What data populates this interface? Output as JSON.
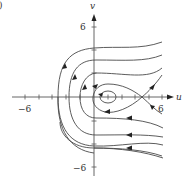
{
  "diagram": {
    "type": "phase-portrait",
    "corner_mark": ")",
    "axes": {
      "x_label": "u",
      "y_label": "v",
      "x_tick_labels": {
        "min": "−6",
        "max": "6"
      },
      "y_tick_labels": {
        "min": "−6",
        "max": "6"
      }
    },
    "features": {
      "center_near": [
        1,
        0
      ],
      "saddle_near": [
        5.2,
        0
      ],
      "trajectory_count": 8
    },
    "colors": {
      "curve": "#4a4a4a",
      "axis": "#555555",
      "background": "#ffffff"
    }
  }
}
